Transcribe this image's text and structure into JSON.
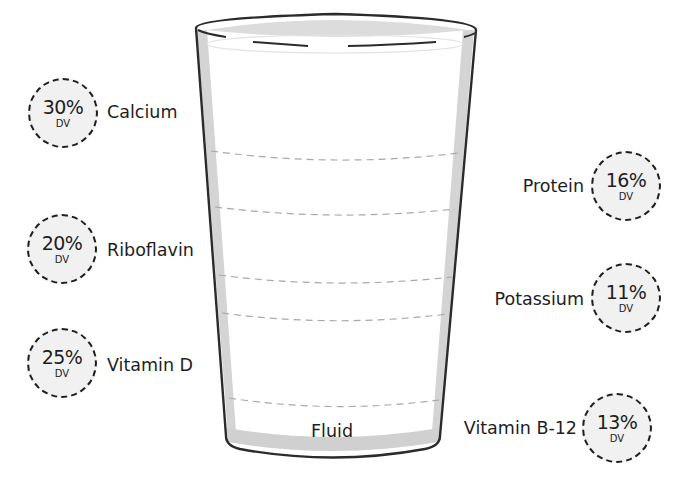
{
  "diagram": {
    "title": "",
    "dv_unit": "DV",
    "glass": {
      "fill_label": "Fluid",
      "outline_color": "#2b2b2b",
      "shade_color": "#d0d0d0",
      "dash_color": "#a8a8a8"
    },
    "badge_fill": "#f1f1f1",
    "left_nutrients": [
      {
        "name": "Calcium",
        "percent": "30%",
        "unit": "DV"
      },
      {
        "name": "Riboflavin",
        "percent": "20%",
        "unit": "DV"
      },
      {
        "name": "Vitamin D",
        "percent": "25%",
        "unit": "DV"
      }
    ],
    "right_nutrients": [
      {
        "name": "Protein",
        "percent": "16%",
        "unit": "DV"
      },
      {
        "name": "Potassium",
        "percent": "11%",
        "unit": "DV"
      },
      {
        "name": "Vitamin B-12",
        "percent": "13%",
        "unit": "DV"
      }
    ]
  }
}
